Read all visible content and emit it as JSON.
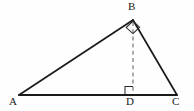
{
  "figure": {
    "kind": "geometry-diagram",
    "background_color": "#fefefe",
    "stroke_color": "#1a1a1a",
    "dash_color": "#5a5a5a",
    "solid_stroke_width": 1.6,
    "dashed_stroke_width": 1.1,
    "dash_pattern": "4,3"
  },
  "points": {
    "A": {
      "label": "A",
      "x": 19,
      "y": 95
    },
    "B": {
      "label": "B",
      "x": 133,
      "y": 20
    },
    "C": {
      "label": "C",
      "x": 177,
      "y": 95
    },
    "D": {
      "label": "D",
      "x": 133,
      "y": 95
    }
  },
  "segments": [
    {
      "name": "side-AB",
      "from": "A",
      "to": "B",
      "style": "solid"
    },
    {
      "name": "side-BC",
      "from": "B",
      "to": "C",
      "style": "solid"
    },
    {
      "name": "side-AC",
      "from": "A",
      "to": "C",
      "style": "solid"
    },
    {
      "name": "altitude-BD",
      "from": "B",
      "to": "D",
      "style": "dashed"
    }
  ],
  "right_angle_markers": [
    {
      "name": "right-angle-at-B",
      "at": "B",
      "size": 9,
      "points": "133,20 126,27 133,33 140,27"
    },
    {
      "name": "right-angle-at-D",
      "at": "D",
      "size": 8,
      "points": "133,95 133,87 125,87 125,95"
    }
  ],
  "labels": {
    "A": "A",
    "B": "B",
    "C": "C",
    "D": "D"
  }
}
